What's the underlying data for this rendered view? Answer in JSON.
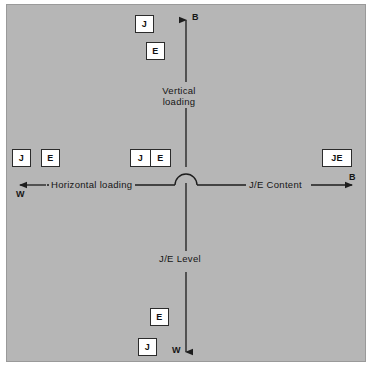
{
  "figure": {
    "type": "quadrant-axis-diagram",
    "background_color": "#b6b6b6",
    "box_fill_color": "#ffffff",
    "line_color": "#1d1d1d"
  },
  "axes": {
    "vertical": {
      "top_label": "B",
      "bottom_label": "W",
      "upper_title": "Vertical\nloading",
      "lower_title": "J/E Level"
    },
    "horizontal": {
      "left_label": "W",
      "right_label": "B",
      "left_title": "Horizontal loading",
      "right_title": "J/E Content"
    }
  },
  "markers": [
    {
      "id": "top-j",
      "label": "J",
      "quadrant": "top",
      "kind": "single"
    },
    {
      "id": "top-e",
      "label": "E",
      "quadrant": "top",
      "kind": "single"
    },
    {
      "id": "left-j",
      "label": "J",
      "quadrant": "left",
      "kind": "single"
    },
    {
      "id": "left-e",
      "label": "E",
      "quadrant": "left",
      "kind": "single"
    },
    {
      "id": "center-j",
      "label": "J",
      "quadrant": "center",
      "kind": "split-left"
    },
    {
      "id": "center-e",
      "label": "E",
      "quadrant": "center",
      "kind": "split-right"
    },
    {
      "id": "right-je",
      "label": "JE",
      "quadrant": "right",
      "kind": "single"
    },
    {
      "id": "bottom-e",
      "label": "E",
      "quadrant": "bottom",
      "kind": "single"
    },
    {
      "id": "bottom-j",
      "label": "J",
      "quadrant": "bottom",
      "kind": "single"
    }
  ]
}
